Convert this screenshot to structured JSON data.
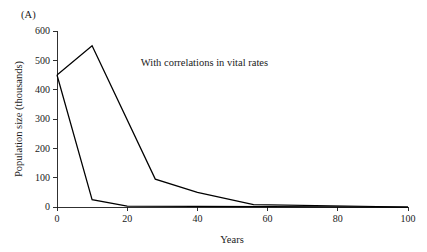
{
  "panel": {
    "label": "(A)"
  },
  "chart_data": {
    "type": "line",
    "title": "",
    "subtitle": "",
    "xlabel": "Years",
    "ylabel": "Population size (thousands)",
    "xlim": [
      0,
      100
    ],
    "ylim": [
      0,
      600
    ],
    "xticks": [
      0,
      20,
      40,
      60,
      80,
      100
    ],
    "yticks": [
      0,
      100,
      200,
      300,
      400,
      500,
      600
    ],
    "xtick_labels": [
      "0",
      "20",
      "40",
      "60",
      "80",
      "100"
    ],
    "ytick_labels": [
      "0",
      "100",
      "200",
      "300",
      "400",
      "500",
      "600"
    ],
    "grid": false,
    "legend": false,
    "legend_position": "none",
    "annotations": [
      {
        "text": "With correlations in vital rates",
        "x": 42,
        "y": 480
      }
    ],
    "series": [
      {
        "name": "upper-trajectory",
        "color": "#000000",
        "x": [
          0,
          10,
          28,
          40,
          56,
          100
        ],
        "values": [
          450,
          550,
          95,
          50,
          8,
          0
        ]
      },
      {
        "name": "lower-trajectory",
        "color": "#000000",
        "x": [
          0,
          10,
          20,
          100
        ],
        "values": [
          450,
          25,
          3,
          0
        ]
      }
    ]
  }
}
